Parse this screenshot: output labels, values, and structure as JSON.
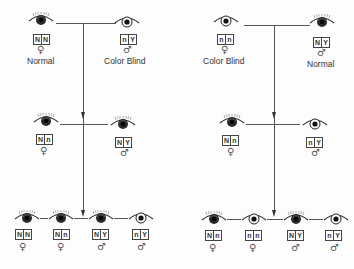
{
  "diagram": {
    "type": "pedigree-color-blindness-inheritance",
    "colors": {
      "line": "#555555",
      "iris_normal": "#1e1e1e",
      "iris_colorblind": "#ffffff",
      "pupil": "#111111"
    },
    "pedigrees": [
      {
        "id": "left",
        "generation1": [
          {
            "sex": "female",
            "sex_symbol": "♀",
            "genotype": [
              "N",
              "N"
            ],
            "phenotype": "normal",
            "label": "Normal"
          },
          {
            "sex": "male",
            "sex_symbol": "♂",
            "genotype": [
              "n",
              "Y"
            ],
            "phenotype": "color-blind",
            "label": "Color Blind"
          }
        ],
        "generation2": [
          {
            "sex": "female",
            "sex_symbol": "♀",
            "genotype": [
              "N",
              "n"
            ],
            "phenotype": "normal"
          },
          {
            "sex": "male",
            "sex_symbol": "♂",
            "genotype": [
              "N",
              "Y"
            ],
            "phenotype": "normal"
          }
        ],
        "generation3": [
          {
            "sex": "female",
            "sex_symbol": "♀",
            "genotype": [
              "N",
              "N"
            ],
            "phenotype": "normal"
          },
          {
            "sex": "female",
            "sex_symbol": "♀",
            "genotype": [
              "N",
              "n"
            ],
            "phenotype": "normal"
          },
          {
            "sex": "male",
            "sex_symbol": "♂",
            "genotype": [
              "N",
              "Y"
            ],
            "phenotype": "normal"
          },
          {
            "sex": "male",
            "sex_symbol": "♂",
            "genotype": [
              "n",
              "Y"
            ],
            "phenotype": "color-blind"
          }
        ]
      },
      {
        "id": "right",
        "generation1": [
          {
            "sex": "female",
            "sex_symbol": "♀",
            "genotype": [
              "n",
              "n"
            ],
            "phenotype": "color-blind",
            "label": "Color Blind"
          },
          {
            "sex": "male",
            "sex_symbol": "♂",
            "genotype": [
              "N",
              "Y"
            ],
            "phenotype": "normal",
            "label": "Normal"
          }
        ],
        "generation2": [
          {
            "sex": "female",
            "sex_symbol": "♀",
            "genotype": [
              "N",
              "n"
            ],
            "phenotype": "normal"
          },
          {
            "sex": "male",
            "sex_symbol": "♂",
            "genotype": [
              "n",
              "Y"
            ],
            "phenotype": "color-blind"
          }
        ],
        "generation3": [
          {
            "sex": "female",
            "sex_symbol": "♀",
            "genotype": [
              "N",
              "n"
            ],
            "phenotype": "normal"
          },
          {
            "sex": "female",
            "sex_symbol": "♀",
            "genotype": [
              "n",
              "n"
            ],
            "phenotype": "color-blind"
          },
          {
            "sex": "male",
            "sex_symbol": "♂",
            "genotype": [
              "N",
              "Y"
            ],
            "phenotype": "normal"
          },
          {
            "sex": "male",
            "sex_symbol": "♂",
            "genotype": [
              "n",
              "Y"
            ],
            "phenotype": "color-blind"
          }
        ]
      }
    ]
  },
  "p": {
    "L": {
      "g1": {
        "f": {
          "a": "N",
          "b": "N",
          "sex": "♀",
          "label": "Normal"
        },
        "m": {
          "a": "n",
          "b": "Y",
          "sex": "♂",
          "label": "Color Blind"
        }
      },
      "g2": {
        "f": {
          "a": "N",
          "b": "n",
          "sex": "♀"
        },
        "m": {
          "a": "N",
          "b": "Y",
          "sex": "♂"
        }
      },
      "g3": [
        {
          "a": "N",
          "b": "N",
          "sex": "♀"
        },
        {
          "a": "N",
          "b": "n",
          "sex": "♀"
        },
        {
          "a": "N",
          "b": "Y",
          "sex": "♂"
        },
        {
          "a": "n",
          "b": "Y",
          "sex": "♂"
        }
      ]
    },
    "R": {
      "g1": {
        "f": {
          "a": "n",
          "b": "n",
          "sex": "♀",
          "label": "Color Blind"
        },
        "m": {
          "a": "N",
          "b": "Y",
          "sex": "♂",
          "label": "Normal"
        }
      },
      "g2": {
        "f": {
          "a": "N",
          "b": "n",
          "sex": "♀"
        },
        "m": {
          "a": "n",
          "b": "Y",
          "sex": "♂"
        }
      },
      "g3": [
        {
          "a": "N",
          "b": "n",
          "sex": "♀"
        },
        {
          "a": "n",
          "b": "n",
          "sex": "♀"
        },
        {
          "a": "N",
          "b": "Y",
          "sex": "♂"
        },
        {
          "a": "n",
          "b": "Y",
          "sex": "♂"
        }
      ]
    }
  }
}
